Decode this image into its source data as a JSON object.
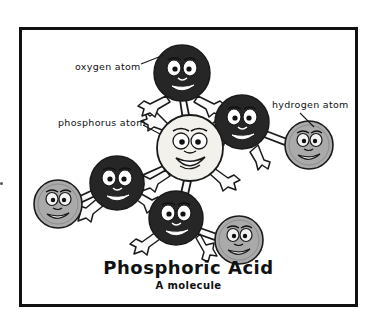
{
  "figure": {
    "title": "Phosphoric Acid",
    "subtitle": "A molecule",
    "border_color": "#111111",
    "background": "#ffffff"
  },
  "labels": {
    "oxygen": "oxygen atom",
    "phosphorus": "phosphorus atom",
    "hydrogen": "hydrogen atom"
  },
  "palette": {
    "oxygen_fill": "#262626",
    "phosphorus_fill": "#f2f1ec",
    "hydrogen_fill": "#aaaaaa",
    "outline": "#1a1a1a",
    "eye_white": "#ffffff",
    "limb_fill": "#fafafa"
  },
  "molecule": {
    "name": "Phosphoric Acid",
    "formula_atoms": [
      {
        "id": "p1",
        "element": "phosphorus",
        "label": "phosphorus atom",
        "cx": 190,
        "cy": 148,
        "r": 33
      },
      {
        "id": "o1",
        "element": "oxygen",
        "label": "oxygen atom",
        "cx": 182,
        "cy": 73,
        "r": 28
      },
      {
        "id": "o2",
        "element": "oxygen",
        "label": "oxygen atom",
        "cx": 242,
        "cy": 122,
        "r": 27
      },
      {
        "id": "o3",
        "element": "oxygen",
        "label": "oxygen atom",
        "cx": 117,
        "cy": 183,
        "r": 27
      },
      {
        "id": "o4",
        "element": "oxygen",
        "label": "oxygen atom",
        "cx": 176,
        "cy": 218,
        "r": 27
      },
      {
        "id": "h1",
        "element": "hydrogen",
        "label": "hydrogen atom",
        "cx": 309,
        "cy": 145,
        "r": 24
      },
      {
        "id": "h2",
        "element": "hydrogen",
        "label": "hydrogen atom",
        "cx": 58,
        "cy": 204,
        "r": 24
      },
      {
        "id": "h3",
        "element": "hydrogen",
        "label": "hydrogen atom",
        "cx": 239,
        "cy": 240,
        "r": 24
      }
    ],
    "bonds": [
      {
        "from": "p1",
        "to": "o1"
      },
      {
        "from": "p1",
        "to": "o2"
      },
      {
        "from": "p1",
        "to": "o3"
      },
      {
        "from": "p1",
        "to": "o4"
      },
      {
        "from": "o2",
        "to": "h1"
      },
      {
        "from": "o3",
        "to": "h2"
      },
      {
        "from": "o4",
        "to": "h3"
      }
    ]
  },
  "callouts": [
    {
      "name": "oxygen",
      "text": "oxygen atom",
      "x1": 141,
      "y1": 64,
      "x2": 163,
      "y2": 56
    },
    {
      "name": "phosphorus",
      "text": "phosphorus atom",
      "x1": 143,
      "y1": 124,
      "x2": 159,
      "y2": 133
    },
    {
      "name": "hydrogen",
      "text": "hydrogen atom",
      "x1": 300,
      "y1": 113,
      "x2": 313,
      "y2": 126
    }
  ]
}
